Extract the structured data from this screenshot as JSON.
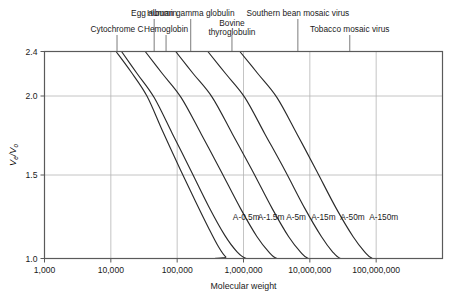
{
  "chart_data": {
    "type": "line",
    "title": "",
    "xlabel": "Molecular weight",
    "ylabel": "Ve/Vo",
    "ylabel_parts": {
      "v1": "V",
      "sub1": "e",
      "slash": "/",
      "v2": "V",
      "sub2": "o"
    },
    "xscale": "log",
    "xlim": [
      1000,
      1000000000
    ],
    "ylim": [
      1.0,
      2.4
    ],
    "grid": true,
    "legend_position": "inline-curve-labels",
    "xticks": [
      {
        "value": 1000,
        "label": "1,000"
      },
      {
        "value": 10000,
        "label": "10,000"
      },
      {
        "value": 100000,
        "label": "100,000"
      },
      {
        "value": 1000000,
        "label": "1,000,000"
      },
      {
        "value": 10000000,
        "label": "10,000,000"
      },
      {
        "value": 100000000,
        "label": "100,000,000"
      }
    ],
    "yticks": [
      {
        "value": 1.0,
        "label": "1.0"
      },
      {
        "value": 1.5,
        "label": "1.5"
      },
      {
        "value": 2.0,
        "label": "2.0"
      },
      {
        "value": 2.4,
        "label": "2.4"
      }
    ],
    "series": [
      {
        "name": "A-0.5m",
        "label": "A-0.5m",
        "label_x": 1100000,
        "label_y": 1.23,
        "exclusion_mw": 500000,
        "points": [
          {
            "x": 12000,
            "y": 2.4
          },
          {
            "x": 20000,
            "y": 2.22
          },
          {
            "x": 35000,
            "y": 2.0
          },
          {
            "x": 60000,
            "y": 1.78
          },
          {
            "x": 110000,
            "y": 1.54
          },
          {
            "x": 190000,
            "y": 1.34
          },
          {
            "x": 300000,
            "y": 1.18
          },
          {
            "x": 420000,
            "y": 1.07
          },
          {
            "x": 540000,
            "y": 1.01
          },
          {
            "x": 700000,
            "y": 1.0
          },
          {
            "x": 1000000000,
            "y": 1.0
          }
        ]
      },
      {
        "name": "A-1.5m",
        "label": "A-1.5m",
        "label_x": 2600000,
        "label_y": 1.23,
        "exclusion_mw": 1500000,
        "points": [
          {
            "x": 14500,
            "y": 2.4
          },
          {
            "x": 25000,
            "y": 2.2
          },
          {
            "x": 45000,
            "y": 1.99
          },
          {
            "x": 85000,
            "y": 1.76
          },
          {
            "x": 160000,
            "y": 1.53
          },
          {
            "x": 300000,
            "y": 1.31
          },
          {
            "x": 520000,
            "y": 1.14
          },
          {
            "x": 800000,
            "y": 1.04
          },
          {
            "x": 1100000,
            "y": 1.0
          },
          {
            "x": 1600000,
            "y": 1.0
          },
          {
            "x": 1000000000,
            "y": 1.0
          }
        ]
      },
      {
        "name": "A-5m",
        "label": "A-5m",
        "label_x": 6200000,
        "label_y": 1.23,
        "exclusion_mw": 5000000,
        "points": [
          {
            "x": 33000,
            "y": 2.4
          },
          {
            "x": 60000,
            "y": 2.2
          },
          {
            "x": 115000,
            "y": 1.99
          },
          {
            "x": 230000,
            "y": 1.76
          },
          {
            "x": 450000,
            "y": 1.53
          },
          {
            "x": 900000,
            "y": 1.3
          },
          {
            "x": 1600000,
            "y": 1.13
          },
          {
            "x": 2400000,
            "y": 1.04
          },
          {
            "x": 3200000,
            "y": 1.0
          },
          {
            "x": 5000000,
            "y": 1.0
          },
          {
            "x": 1000000000,
            "y": 1.0
          }
        ]
      },
      {
        "name": "A-15m",
        "label": "A-15m",
        "label_x": 16000000,
        "label_y": 1.23,
        "exclusion_mw": 15000000,
        "points": [
          {
            "x": 95000,
            "y": 2.4
          },
          {
            "x": 175000,
            "y": 2.2
          },
          {
            "x": 340000,
            "y": 1.99
          },
          {
            "x": 680000,
            "y": 1.76
          },
          {
            "x": 1350000,
            "y": 1.53
          },
          {
            "x": 2700000,
            "y": 1.3
          },
          {
            "x": 4800000,
            "y": 1.13
          },
          {
            "x": 7200000,
            "y": 1.04
          },
          {
            "x": 9500000,
            "y": 1.0
          },
          {
            "x": 15000000,
            "y": 1.0
          },
          {
            "x": 1000000000,
            "y": 1.0
          }
        ]
      },
      {
        "name": "A-50m",
        "label": "A-50m",
        "label_x": 44000000,
        "label_y": 1.23,
        "exclusion_mw": 50000000,
        "points": [
          {
            "x": 290000,
            "y": 2.4
          },
          {
            "x": 540000,
            "y": 2.2
          },
          {
            "x": 1050000,
            "y": 1.99
          },
          {
            "x": 2100000,
            "y": 1.76
          },
          {
            "x": 4200000,
            "y": 1.53
          },
          {
            "x": 8400000,
            "y": 1.3
          },
          {
            "x": 15000000,
            "y": 1.13
          },
          {
            "x": 22000000,
            "y": 1.04
          },
          {
            "x": 29000000,
            "y": 1.0
          },
          {
            "x": 45000000,
            "y": 1.0
          },
          {
            "x": 1000000000,
            "y": 1.0
          }
        ]
      },
      {
        "name": "A-150m",
        "label": "A-150m",
        "label_x": 130000000,
        "label_y": 1.23,
        "exclusion_mw": 150000000,
        "points": [
          {
            "x": 880000,
            "y": 2.4
          },
          {
            "x": 1650000,
            "y": 2.2
          },
          {
            "x": 3200000,
            "y": 1.99
          },
          {
            "x": 6400000,
            "y": 1.76
          },
          {
            "x": 12500000,
            "y": 1.53
          },
          {
            "x": 25000000,
            "y": 1.3
          },
          {
            "x": 45000000,
            "y": 1.13
          },
          {
            "x": 67000000,
            "y": 1.04
          },
          {
            "x": 88000000,
            "y": 1.0
          },
          {
            "x": 140000000,
            "y": 1.0
          },
          {
            "x": 1000000000,
            "y": 1.0
          }
        ]
      }
    ],
    "annotations": [
      {
        "label": "Cytochrome C",
        "mw": 12400,
        "row": 1
      },
      {
        "label": "Egg albumin",
        "mw": 45000,
        "row": 0
      },
      {
        "label": "Hemoglobin",
        "mw": 68000,
        "row": 1
      },
      {
        "label": "Human gamma globulin",
        "mw": 160000,
        "row": 0
      },
      {
        "label": "Bovine thyroglobulin",
        "mw": 670000,
        "row": 1
      },
      {
        "label": "Southern bean mosaic virus",
        "mw": 6600000,
        "row": 0
      },
      {
        "label": "Tobacco mosaic virus",
        "mw": 40000000,
        "row": 1
      }
    ],
    "colors": {
      "curve": "#2b2b2b",
      "axis": "#5a5a5a",
      "grid": "#b5b5b5",
      "text": "#1a1a1a",
      "background": "#ffffff"
    }
  }
}
